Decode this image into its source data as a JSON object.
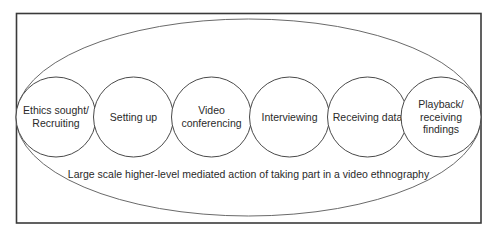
{
  "diagram": {
    "type": "nested-activity-diagram",
    "outer_caption": "Large scale higher-level mediated action of taking part in a video ethnography",
    "stages": [
      {
        "lines": [
          "Ethics sought/",
          "Recruiting"
        ]
      },
      {
        "lines": [
          "Setting up"
        ]
      },
      {
        "lines": [
          "Video",
          "conferencing"
        ]
      },
      {
        "lines": [
          "Interviewing"
        ]
      },
      {
        "lines": [
          "Receiving data"
        ]
      },
      {
        "lines": [
          "Playback/",
          "receiving",
          "findings"
        ]
      }
    ],
    "colors": {
      "frame": "#3a3a3a",
      "ellipse": "#6a6a6a",
      "circle": "#4a4a4a",
      "text": "#2a2a2a",
      "background": "#ffffff"
    }
  }
}
